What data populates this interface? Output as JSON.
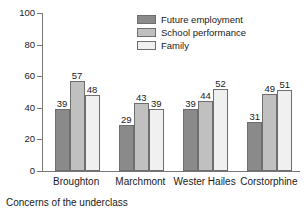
{
  "chart_data": {
    "type": "bar",
    "title": "",
    "caption": "Concerns of the underclass",
    "xlabel": "",
    "ylabel": "",
    "ylim": [
      0,
      100
    ],
    "yticks": [
      0,
      20,
      40,
      60,
      80,
      100
    ],
    "grid": false,
    "legend_position": "top-right",
    "categories": [
      "Broughton",
      "Marchmont",
      "Wester Hailes",
      "Corstorphine"
    ],
    "series": [
      {
        "name": "Future employment",
        "color": "#8a8a8a",
        "values": [
          39,
          29,
          39,
          31
        ]
      },
      {
        "name": "School performance",
        "color": "#c0c0c0",
        "values": [
          57,
          43,
          44,
          49
        ]
      },
      {
        "name": "Family",
        "color": "#f0f0f0",
        "values": [
          48,
          39,
          52,
          51
        ]
      }
    ]
  },
  "colors": {
    "axis": "#777777",
    "bar_outline": "#6e6e6e",
    "text": "#1a1a1a",
    "background": "#ffffff"
  }
}
